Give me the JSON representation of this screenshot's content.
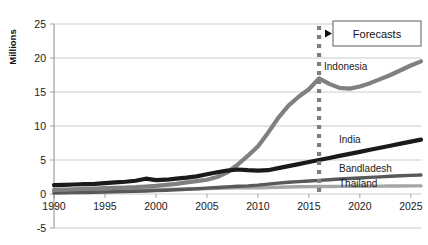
{
  "chart_data": {
    "type": "line",
    "title": "",
    "xlabel": "",
    "ylabel": "Millions",
    "xlim": [
      1990,
      2026
    ],
    "ylim": [
      -5,
      25
    ],
    "yticks": [
      -5,
      0,
      5,
      10,
      15,
      20,
      25
    ],
    "xticks": [
      1990,
      1995,
      2000,
      2005,
      2010,
      2015,
      2020,
      2025
    ],
    "grid": "horizontal",
    "legend_position": "inline-right-labels",
    "annotations": [
      {
        "name": "forecast-divider",
        "label": "Forecasts",
        "x": 2016,
        "style": "dotted-vertical-line-with-arrow-and-box"
      }
    ],
    "series": [
      {
        "name": "Indonesia",
        "color": "#808080",
        "width": 4.2,
        "x": [
          1990,
          1991,
          1992,
          1993,
          1994,
          1995,
          1996,
          1997,
          1998,
          1999,
          2000,
          2001,
          2002,
          2003,
          2004,
          2005,
          2006,
          2007,
          2008,
          2009,
          2010,
          2011,
          2012,
          2013,
          2014,
          2015,
          2016,
          2017,
          2018,
          2019,
          2020,
          2021,
          2022,
          2023,
          2024,
          2025,
          2026
        ],
        "y": [
          0.6,
          0.65,
          0.7,
          0.75,
          0.8,
          0.85,
          0.9,
          0.95,
          1.0,
          1.1,
          1.2,
          1.35,
          1.5,
          1.7,
          1.9,
          2.1,
          2.5,
          3.2,
          4.3,
          5.6,
          7.0,
          9.0,
          11.2,
          13.0,
          14.3,
          15.4,
          17.0,
          16.2,
          15.6,
          15.5,
          15.8,
          16.3,
          16.9,
          17.5,
          18.2,
          18.9,
          19.5
        ]
      },
      {
        "name": "India",
        "color": "#1a1a1a",
        "width": 4.2,
        "x": [
          1990,
          1991,
          1992,
          1993,
          1994,
          1995,
          1996,
          1997,
          1998,
          1999,
          2000,
          2001,
          2002,
          2003,
          2004,
          2005,
          2006,
          2007,
          2008,
          2009,
          2010,
          2011,
          2012,
          2013,
          2014,
          2015,
          2016,
          2017,
          2018,
          2019,
          2020,
          2021,
          2022,
          2023,
          2024,
          2025,
          2026
        ],
        "y": [
          1.3,
          1.35,
          1.4,
          1.45,
          1.5,
          1.6,
          1.7,
          1.8,
          1.95,
          2.25,
          2.05,
          2.1,
          2.25,
          2.4,
          2.6,
          2.9,
          3.2,
          3.45,
          3.6,
          3.5,
          3.45,
          3.5,
          3.8,
          4.1,
          4.4,
          4.7,
          5.0,
          5.3,
          5.6,
          5.9,
          6.2,
          6.5,
          6.8,
          7.1,
          7.4,
          7.7,
          8.0
        ]
      },
      {
        "name": "Bandladesh",
        "color": "#595959",
        "width": 3.4,
        "x": [
          1990,
          1991,
          1992,
          1993,
          1994,
          1995,
          1996,
          1997,
          1998,
          1999,
          2000,
          2001,
          2002,
          2003,
          2004,
          2005,
          2006,
          2007,
          2008,
          2009,
          2010,
          2011,
          2012,
          2013,
          2014,
          2015,
          2016,
          2017,
          2018,
          2019,
          2020,
          2021,
          2022,
          2023,
          2024,
          2025,
          2026
        ],
        "y": [
          0.15,
          0.17,
          0.2,
          0.22,
          0.25,
          0.28,
          0.32,
          0.36,
          0.4,
          0.45,
          0.5,
          0.56,
          0.62,
          0.7,
          0.78,
          0.86,
          0.95,
          1.05,
          1.15,
          1.2,
          1.3,
          1.45,
          1.6,
          1.72,
          1.82,
          1.92,
          2.0,
          2.1,
          2.2,
          2.28,
          2.36,
          2.44,
          2.52,
          2.6,
          2.68,
          2.74,
          2.8
        ]
      },
      {
        "name": "Thailand",
        "color": "#a6a6a6",
        "width": 3.4,
        "x": [
          1990,
          1991,
          1992,
          1993,
          1994,
          1995,
          1996,
          1997,
          1998,
          1999,
          2000,
          2001,
          2002,
          2003,
          2004,
          2005,
          2006,
          2007,
          2008,
          2009,
          2010,
          2011,
          2012,
          2013,
          2014,
          2015,
          2016,
          2017,
          2018,
          2019,
          2020,
          2021,
          2022,
          2023,
          2024,
          2025,
          2026
        ],
        "y": [
          0.45,
          0.46,
          0.48,
          0.5,
          0.52,
          0.55,
          0.58,
          0.6,
          0.6,
          0.62,
          0.65,
          0.68,
          0.7,
          0.73,
          0.76,
          0.8,
          0.84,
          0.88,
          0.92,
          0.9,
          0.93,
          0.96,
          1.0,
          1.03,
          1.06,
          1.08,
          1.1,
          1.11,
          1.12,
          1.13,
          1.14,
          1.15,
          1.16,
          1.17,
          1.18,
          1.19,
          1.2
        ]
      }
    ]
  },
  "axis": {
    "ylabel": "Millions",
    "ytick_labels": [
      "25",
      "20",
      "15",
      "10",
      "5",
      "0",
      "-5"
    ],
    "xtick_labels": [
      "1990",
      "1995",
      "2000",
      "2005",
      "2010",
      "2015",
      "2020",
      "2025"
    ]
  },
  "series_labels": [
    {
      "text": "Indonesia",
      "name": "series-label-indonesia"
    },
    {
      "text": "India",
      "name": "series-label-india"
    },
    {
      "text": "Bandladesh",
      "name": "series-label-bandladesh"
    },
    {
      "text": "Thailand",
      "name": "series-label-thailand"
    }
  ],
  "forecast": {
    "label": "Forecasts"
  },
  "colors": {
    "indonesia": "#808080",
    "india": "#1a1a1a",
    "bandladesh": "#595959",
    "thailand": "#a6a6a6",
    "gridline": "#b5b5b5",
    "axis": "#8c8c8c",
    "divider": "#7f7f7f",
    "text": "#1a1a1a"
  }
}
